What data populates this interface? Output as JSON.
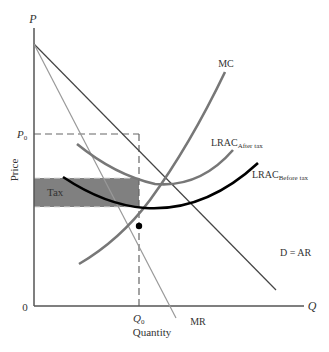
{
  "diagram": {
    "type": "monopoly-tax-diagram",
    "axes": {
      "y_axis_symbol": "P",
      "x_axis_symbol": "Q",
      "origin_label": "0",
      "y_axis_title": "Price",
      "x_axis_title": "Quantity"
    },
    "markers": {
      "price_label": "P",
      "price_sub": "0",
      "quantity_label": "Q",
      "quantity_sub": "0"
    },
    "curves": {
      "mc": "MC",
      "lrac_after_main": "LRAC",
      "lrac_after_sub": "After tax",
      "lrac_before_main": "LRAC",
      "lrac_before_sub": "Before tax",
      "demand": "D = AR",
      "mr": "MR"
    },
    "regions": {
      "tax_label": "Tax"
    },
    "colors": {
      "axis": "#555555",
      "demand": "#444444",
      "mr": "#999999",
      "mc": "#777777",
      "lrac_after": "#777777",
      "lrac_before": "#000000",
      "tax_fill": "#808080",
      "dashes": "#666666"
    }
  }
}
